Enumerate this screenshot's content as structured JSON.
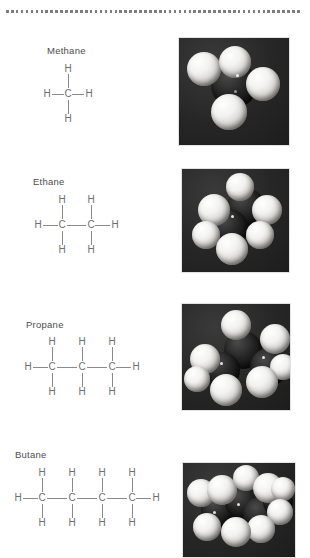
{
  "figure": {
    "background_color": "#ffffff",
    "rule": {
      "style": "dotted",
      "color": "#7d7d7d",
      "dot_count": 60
    }
  },
  "molecules": [
    {
      "name": "Methane",
      "formula": "CH4",
      "carbon_count": 1,
      "carbon_label": "C",
      "hydrogen_label": "H",
      "hydrogen_count": 4,
      "model": {
        "background_color": "#2b2b2b",
        "carbon_color": "#101010",
        "hydrogen_color": "#f2f2f0"
      }
    },
    {
      "name": "Ethane",
      "formula": "C2H6",
      "carbon_count": 2,
      "carbon_label": "C",
      "hydrogen_label": "H",
      "hydrogen_count": 6,
      "model": {
        "background_color": "#2b2b2b",
        "carbon_color": "#101010",
        "hydrogen_color": "#f2f2f0"
      }
    },
    {
      "name": "Propane",
      "formula": "C3H8",
      "carbon_count": 3,
      "carbon_label": "C",
      "hydrogen_label": "H",
      "hydrogen_count": 8,
      "model": {
        "background_color": "#2b2b2b",
        "carbon_color": "#101010",
        "hydrogen_color": "#f2f2f0"
      }
    },
    {
      "name": "Butane",
      "formula": "C4H10",
      "carbon_count": 4,
      "carbon_label": "C",
      "hydrogen_label": "H",
      "hydrogen_count": 10,
      "model": {
        "background_color": "#2b2b2b",
        "carbon_color": "#101010",
        "hydrogen_color": "#f2f2f0"
      }
    }
  ]
}
